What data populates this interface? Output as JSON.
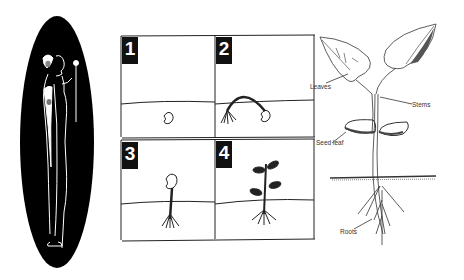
{
  "figure_oval": {
    "description": "Stylized Egyptian-style figure holding a flower, white lines on black oval",
    "colors": {
      "background": "#000000",
      "lines": "#ffffff"
    }
  },
  "germination_sequence": {
    "panels": [
      {
        "number": "1",
        "stage": "seed in soil"
      },
      {
        "number": "2",
        "stage": "root emerging, stem arching"
      },
      {
        "number": "3",
        "stage": "seedling upright with seed"
      },
      {
        "number": "4",
        "stage": "young plant with leaves"
      }
    ]
  },
  "plant_diagram": {
    "labels": {
      "leaves": "Leaves",
      "stems": "Stems",
      "seed_leaf": "Seed leaf",
      "roots": "Roots"
    }
  }
}
